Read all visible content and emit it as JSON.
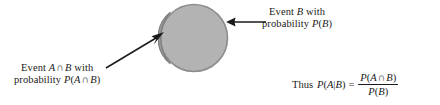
{
  "figure": {
    "type": "conditional-probability-venn-diagram",
    "background_color": "#ffffff",
    "ink_color": "#1a1a1a"
  },
  "shapes": {
    "circle_b": {
      "name": "Event B circle",
      "fill": "#b3b3b3",
      "stroke": "#8c8c8c",
      "cx": 36,
      "cy": 36,
      "r": 34
    },
    "lens_ab": {
      "name": "Event A intersect B lens",
      "fill": "#9a9a9a",
      "stroke": "#7d7d7d"
    }
  },
  "labels": {
    "event_b": {
      "line1_pre": "Event ",
      "line1_var": "B",
      "line1_post": " with",
      "line2_pre": "probability ",
      "line2_p": "P",
      "line2_open": "(",
      "line2_var": "B",
      "line2_close": ")"
    },
    "event_ab": {
      "line1_pre": "Event ",
      "line1_var_a": "A",
      "line1_cap": "∩",
      "line1_var_b": "B",
      "line1_post": " with",
      "line2_pre": "probability ",
      "line2_p": "P",
      "line2_open": "(",
      "line2_var_a": "A",
      "line2_cap": "∩",
      "line2_var_b": "B",
      "line2_close": ")"
    }
  },
  "formula": {
    "thus": "Thus",
    "lhs_p": "P",
    "lhs_open": "(",
    "lhs_a": "A",
    "lhs_bar": "|",
    "lhs_b": "B",
    "lhs_close": ")",
    "equals": "=",
    "numerator_p": "P",
    "numerator_open": "(",
    "numerator_a": "A",
    "numerator_cap": "∩",
    "numerator_b": "B",
    "numerator_close": ")",
    "denominator_p": "P",
    "denominator_open": "(",
    "denominator_b": "B",
    "denominator_close": ")"
  },
  "arrows": {
    "to_circle_b": {
      "name": "arrow pointing left to circle edge",
      "direction": "left",
      "color": "#1a1a1a"
    },
    "to_lens_ab": {
      "name": "arrow pointing up-right to lens region",
      "direction": "up-right",
      "color": "#1a1a1a"
    }
  }
}
